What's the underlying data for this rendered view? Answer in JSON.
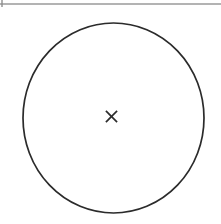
{
  "page": {
    "background_color": "#ffffff",
    "width": 221,
    "height": 224
  },
  "top_rule": {
    "name": "horizontal-rule",
    "color": "#9a9a9a",
    "x1": 0,
    "x2": 221,
    "y": 4,
    "thickness": 1.6
  },
  "left_tick": {
    "name": "left-edge-tick",
    "color": "#8f8f8f",
    "x": 2,
    "y1": 0,
    "y2": 7,
    "thickness": 1.4
  },
  "circle": {
    "name": "circle-outline",
    "stroke_color": "#2b2b2b",
    "fill_color": "#ffffff",
    "stroke_width": 1.7,
    "center_x": 113.5,
    "center_y": 118,
    "radius_x": 90.5,
    "radius_y": 95
  },
  "center_mark": {
    "name": "center-cross-mark",
    "glyph": "x-mark",
    "label": "×",
    "color": "#2b2b2b",
    "center_x": 111.5,
    "center_y": 116.5,
    "arm_half_length": 5.6,
    "stroke_width": 1.7
  },
  "chart_data": {
    "type": "diagram",
    "title": "",
    "shapes": [
      {
        "kind": "ellipse",
        "label": "circle",
        "cx": 113.5,
        "cy": 118,
        "rx": 90.5,
        "ry": 95,
        "stroke": "#2b2b2b",
        "fill": "none"
      },
      {
        "kind": "cross",
        "label": "center mark",
        "cx": 111.5,
        "cy": 116.5,
        "size": 11.2,
        "stroke": "#2b2b2b"
      },
      {
        "kind": "line",
        "label": "top rule",
        "x1": 0,
        "y1": 4,
        "x2": 221,
        "y2": 4,
        "stroke": "#9a9a9a"
      },
      {
        "kind": "line",
        "label": "left tick",
        "x1": 2,
        "y1": 0,
        "x2": 2,
        "y2": 7,
        "stroke": "#8f8f8f"
      }
    ]
  }
}
